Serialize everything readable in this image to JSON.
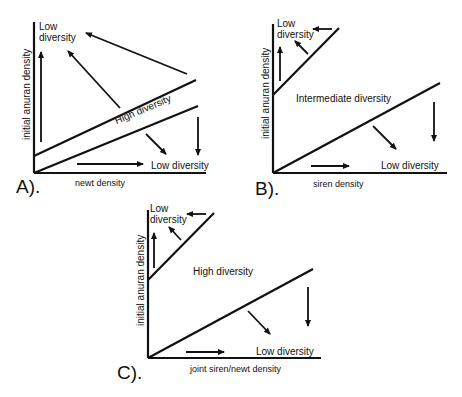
{
  "panels": [
    {
      "id": "A",
      "letter": "A).",
      "xlabel": "newt density",
      "ylabel": "initial anuran density",
      "regions": {
        "top_left": "Low\ndiversity",
        "top_left_line1": "Low",
        "top_left_line2": "diversity",
        "middle": "High diversity",
        "bottom_right": "Low diversity"
      }
    },
    {
      "id": "B",
      "letter": "B).",
      "xlabel": "siren density",
      "ylabel": "initial anuran density",
      "regions": {
        "top_left_line1": "Low",
        "top_left_line2": "diversity",
        "middle": "Intermediate diversity",
        "bottom_right": "Low diversity"
      }
    },
    {
      "id": "C",
      "letter": "C).",
      "xlabel": "joint siren/newt density",
      "ylabel": "initial anuran density",
      "regions": {
        "top_left_line1": "Low",
        "top_left_line2": "diversity",
        "middle": "High diversity",
        "bottom_right": "Low diversity"
      }
    }
  ],
  "colors": {
    "line": "#111111",
    "background": "#ffffff"
  }
}
